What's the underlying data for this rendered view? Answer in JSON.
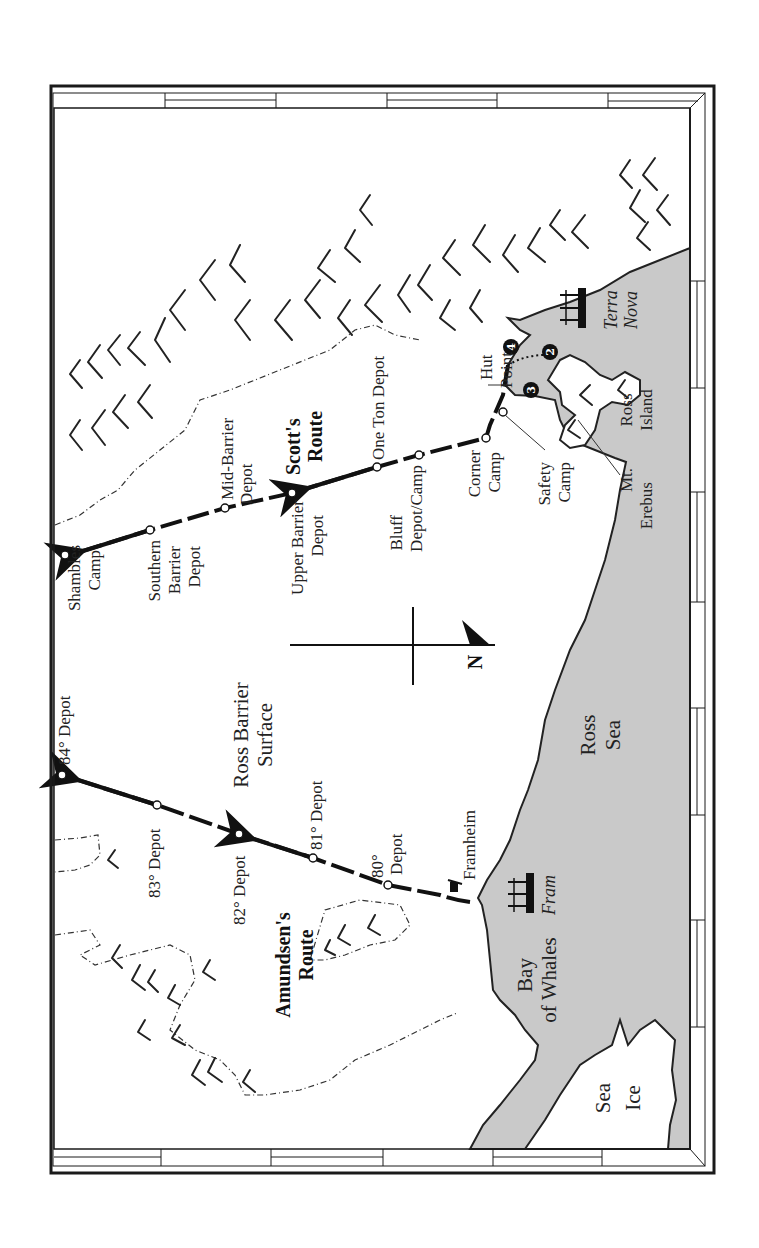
{
  "map": {
    "orientation": "rotated 90 degrees counter-clockwise (north points right)",
    "colors": {
      "sea": "#c9c9c9",
      "land": "#ffffff",
      "ink": "#1a1a1a",
      "frame": "#1a1a1a"
    },
    "compass": {
      "label": "N"
    },
    "regions": {
      "ross_sea": "Ross Sea",
      "ross_barrier_1": "Ross Barrier",
      "ross_barrier_2": "Surface",
      "bay_of_whales_1": "Bay",
      "bay_of_whales_2": "of Whales",
      "sea_ice_1": "Sea",
      "sea_ice_2": "Ice",
      "ross_island_1": "Ross",
      "ross_island_2": "Island",
      "ross_sea_1": "Ross",
      "ross_sea_2": "Sea"
    },
    "routes": {
      "scott": {
        "title_1": "Scott's",
        "title_2": "Route"
      },
      "amundsen": {
        "title_1": "Amundsen's",
        "title_2": "Route"
      }
    },
    "scott_places": {
      "shambles_1": "Shambles",
      "shambles_2": "Camp",
      "southern_1": "Southern",
      "southern_2": "Barrier",
      "southern_3": "Depot",
      "mid_1": "Mid-Barrier",
      "mid_2": "Depot",
      "upper_1": "Upper Barrier",
      "upper_2": "Depot",
      "one_ton": "One Ton Depot",
      "bluff_1": "Bluff",
      "bluff_2": "Depot/Camp",
      "corner_1": "Corner",
      "corner_2": "Camp",
      "safety_1": "Safety",
      "safety_2": "Camp",
      "hut_1": "Hut",
      "hut_2": "Point",
      "erebus_1": "Mt.",
      "erebus_2": "Erebus"
    },
    "amundsen_places": {
      "d84": "84° Depot",
      "d83": "83° Depot",
      "d82": "82° Depot",
      "d81": "81° Depot",
      "d80_1": "80°",
      "d80_2": "Depot",
      "framheim": "Framheim"
    },
    "ships": {
      "terra_nova_1": "Terra",
      "terra_nova_2": "Nova",
      "fram": "Fram"
    },
    "markers": {
      "m2": "2",
      "m3": "3",
      "m4": "4"
    }
  }
}
